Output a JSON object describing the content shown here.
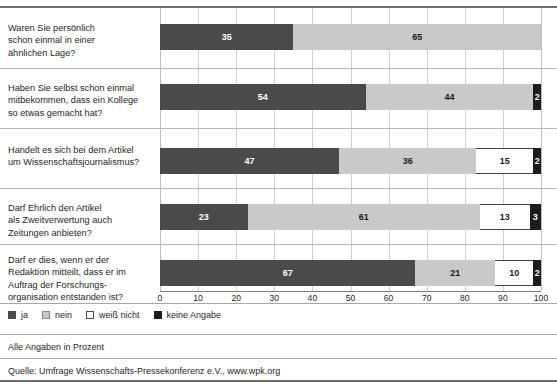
{
  "chart_data": {
    "type": "bar",
    "orientation": "horizontal",
    "stacked": true,
    "title": "",
    "xlabel": "",
    "ylabel": "",
    "xlim": [
      0,
      100
    ],
    "xticks": [
      0,
      10,
      20,
      30,
      40,
      50,
      60,
      70,
      80,
      90,
      100
    ],
    "grid": true,
    "legend_position": "bottom-left",
    "categories": [
      "Waren Sie persönlich schon einmal in einer ähnlichen Lage?",
      "Haben Sie selbst schon einmal mitbekommen, dass ein Kollege so etwas gemacht hat?",
      "Handelt es sich bei dem Artikel um Wissenschaftsjournalismus?",
      "Darf Ehrlich den Artikel als Zweitverwertung auch Zeitungen anbieten?",
      "Darf er dies, wenn er der Redaktion mitteilt, dass er im Auftrag der Forschungsorganisation entstanden ist?"
    ],
    "series": [
      {
        "name": "ja",
        "color": "#4a4a4a",
        "values": [
          35,
          54,
          47,
          23,
          67
        ]
      },
      {
        "name": "nein",
        "color": "#c9c9c9",
        "values": [
          65,
          44,
          36,
          61,
          21
        ]
      },
      {
        "name": "weiß nicht",
        "color": "#ffffff",
        "values": [
          0,
          0,
          15,
          13,
          10
        ]
      },
      {
        "name": "keine Angabe",
        "color": "#1c1c1c",
        "values": [
          0,
          2,
          2,
          3,
          2
        ]
      }
    ]
  },
  "rows": [
    {
      "label_lines": [
        "Waren Sie persönlich",
        "schon einmal in einer",
        "ähnlichen Lage?"
      ],
      "segments": [
        {
          "series": "ja",
          "value": 35,
          "label": "35"
        },
        {
          "series": "nein",
          "value": 65,
          "label": "65"
        }
      ]
    },
    {
      "label_lines": [
        "Haben Sie selbst schon einmal",
        "mitbekommen, dass ein Kollege",
        "so etwas gemacht hat?"
      ],
      "segments": [
        {
          "series": "ja",
          "value": 54,
          "label": "54"
        },
        {
          "series": "nein",
          "value": 44,
          "label": "44"
        },
        {
          "series": "keine Angabe",
          "value": 2,
          "label": "2"
        }
      ]
    },
    {
      "label_lines": [
        "Handelt es sich bei dem Artikel",
        "um Wissenschaftsjournalismus?"
      ],
      "segments": [
        {
          "series": "ja",
          "value": 47,
          "label": "47"
        },
        {
          "series": "nein",
          "value": 36,
          "label": "36"
        },
        {
          "series": "weiß nicht",
          "value": 15,
          "label": "15"
        },
        {
          "series": "keine Angabe",
          "value": 2,
          "label": "2"
        }
      ]
    },
    {
      "label_lines": [
        "Darf Ehrlich den Artikel",
        "als Zweitverwertung auch",
        "Zeitungen anbieten?"
      ],
      "segments": [
        {
          "series": "ja",
          "value": 23,
          "label": "23"
        },
        {
          "series": "nein",
          "value": 61,
          "label": "61"
        },
        {
          "series": "weiß nicht",
          "value": 13,
          "label": "13"
        },
        {
          "series": "keine Angabe",
          "value": 3,
          "label": "3"
        }
      ]
    },
    {
      "label_lines": [
        "Darf er dies, wenn er der",
        "Redaktion mitteilt, dass er im",
        "Auftrag der Forschungs-",
        "organisation entstanden ist?"
      ],
      "segments": [
        {
          "series": "ja",
          "value": 67,
          "label": "67"
        },
        {
          "series": "nein",
          "value": 21,
          "label": "21"
        },
        {
          "series": "weiß nicht",
          "value": 10,
          "label": "10"
        },
        {
          "series": "keine Angabe",
          "value": 2,
          "label": "2"
        }
      ]
    }
  ],
  "axis": {
    "ticks": [
      "0",
      "10",
      "20",
      "30",
      "40",
      "50",
      "60",
      "70",
      "80",
      "90",
      "100"
    ]
  },
  "legend": {
    "items": [
      {
        "label": "ja",
        "swatch": "sw-ja"
      },
      {
        "label": "nein",
        "swatch": "sw-nein"
      },
      {
        "label": "weiß nicht",
        "swatch": "sw-weiss"
      },
      {
        "label": "keine Angabe",
        "swatch": "sw-keine"
      }
    ]
  },
  "footer": {
    "units_note": "Alle Angaben in Prozent",
    "source": "Quelle: Umfrage Wissenschafts-Pressekonferenz e.V., www.wpk.org"
  }
}
